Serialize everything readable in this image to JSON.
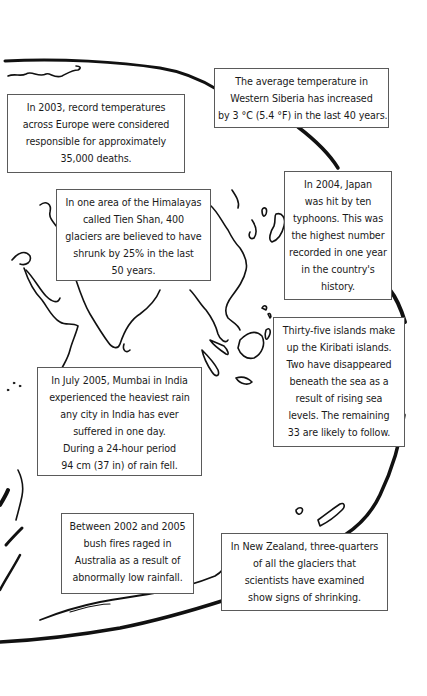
{
  "page": {
    "colors": {
      "background": "#ffffff",
      "outline": "#111111",
      "box_border": "#5a5a5a",
      "text": "#1a1a1a"
    }
  },
  "facts": [
    {
      "id": "western-siberia",
      "lines": [
        "The average temperature in",
        "Western Siberia has increased",
        "by 3 °C (5.4 °F) in the last 40 years."
      ]
    },
    {
      "id": "europe-2003",
      "lines": [
        "In 2003, record temperatures",
        "across Europe were considered",
        "responsible for approximately",
        "35,000 deaths."
      ]
    },
    {
      "id": "himalayas-tien-shan",
      "lines": [
        "In one area of the Himalayas",
        "called Tien Shan, 400",
        "glaciers are believed to have",
        "shrunk by 25% in the last",
        "50 years."
      ]
    },
    {
      "id": "japan-2004",
      "lines": [
        "In 2004, Japan",
        "was hit by ten",
        "typhoons. This was",
        "the highest number",
        "recorded in one year",
        "in the country's",
        "history."
      ]
    },
    {
      "id": "kiribati",
      "lines": [
        "Thirty-five islands make",
        "up the Kiribati islands.",
        "Two have disappeared",
        "beneath the sea as a",
        "result of rising sea",
        "levels. The remaining",
        "33 are likely to follow."
      ]
    },
    {
      "id": "mumbai-2005",
      "lines": [
        "In July 2005, Mumbai in India",
        "experienced the heaviest rain",
        "any city in India has ever",
        "suffered in one day.",
        "During a 24-hour period",
        "94 cm (37 in) of rain fell."
      ]
    },
    {
      "id": "australia-bushfires",
      "lines": [
        "Between 2002 and 2005",
        "bush fires raged in",
        "Australia as a result of",
        "abnormally low rainfall."
      ]
    },
    {
      "id": "new-zealand-glaciers",
      "lines": [
        "In New Zealand, three-quarters",
        "of all the glaciers that",
        "scientists have examined",
        "show signs of shrinking."
      ]
    }
  ]
}
